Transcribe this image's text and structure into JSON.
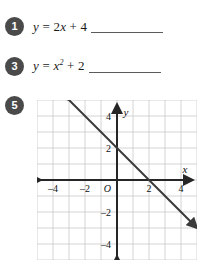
{
  "worksheet": {
    "problems": [
      {
        "number": "1",
        "equation_plain": "y = 2x + 4",
        "lhs": "y",
        "eq": "=",
        "rhs_coeff": "2",
        "rhs_var": "x",
        "rhs_tail": "+ 4",
        "has_answer_line": true
      },
      {
        "number": "3",
        "equation_plain": "y = x2 + 2",
        "lhs": "y",
        "eq": "=",
        "rhs_var": "x",
        "rhs_exp": "2",
        "rhs_tail": "+ 2",
        "has_answer_line": true
      },
      {
        "number": "5",
        "has_answer_line": false
      }
    ]
  },
  "chart_data": {
    "type": "line",
    "title": "",
    "xlabel": "x",
    "ylabel": "y",
    "xlim": [
      -5,
      5
    ],
    "ylim": [
      -5,
      5
    ],
    "grid": true,
    "grid_step": 1,
    "legend": "none",
    "origin_label": "O",
    "x_ticks": [
      -4,
      -2,
      2,
      4
    ],
    "x_tick_labels": [
      "–4",
      "–2",
      "2",
      "4"
    ],
    "y_ticks": [
      4,
      2,
      -2,
      -4
    ],
    "y_tick_labels": [
      "4",
      "2",
      "–2",
      "–4"
    ],
    "series": [
      {
        "name": "line",
        "equation": "y = -x + 2",
        "slope": -1,
        "intercept": 2,
        "points": [
          [
            -3,
            5
          ],
          [
            0,
            2
          ],
          [
            2,
            0
          ],
          [
            5,
            -3
          ]
        ],
        "color": "#3a3a3a",
        "arrow_start": true,
        "arrow_end": true
      }
    ],
    "axis_color": "#262626",
    "grid_color": "#c9c9c9"
  }
}
